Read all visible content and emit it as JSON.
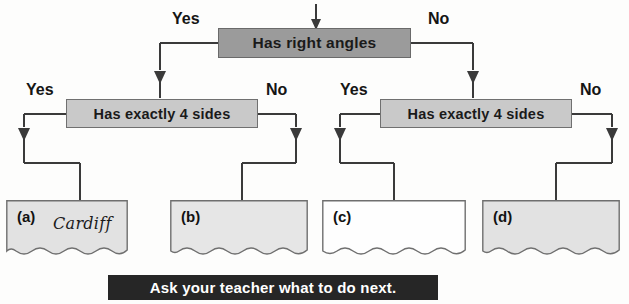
{
  "diagram": {
    "entry_arrow": "down-arrow-icon",
    "root": {
      "label": "Has right angles",
      "yes_label": "Yes",
      "no_label": "No"
    },
    "branches": [
      {
        "label": "Has exactly 4 sides",
        "yes_label": "Yes",
        "no_label": "No"
      },
      {
        "label": "Has exactly 4 sides",
        "yes_label": "Yes",
        "no_label": "No"
      }
    ],
    "answers": [
      {
        "tag": "(a)",
        "value": "Cardiff"
      },
      {
        "tag": "(b)",
        "value": ""
      },
      {
        "tag": "(c)",
        "value": ""
      },
      {
        "tag": "(d)",
        "value": ""
      }
    ],
    "banner": "Ask your teacher what to do next."
  },
  "colors": {
    "root_box": "#9b9b9b",
    "sub_box": "#c9c9c9",
    "answer_shaded": "#e2e2e2",
    "answer_plain": "#fefefe",
    "line": "#3a3a3a",
    "banner_bg": "#262626",
    "banner_text": "#ffffff"
  }
}
